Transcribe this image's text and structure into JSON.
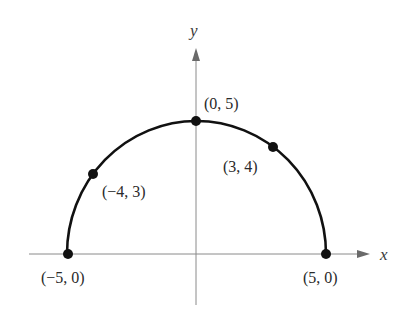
{
  "figure": {
    "axes": {
      "x_label": "x",
      "y_label": "y"
    },
    "points": [
      {
        "label": "(−5, 0)",
        "x": -5,
        "y": 0
      },
      {
        "label": "(−4, 3)",
        "x": -4,
        "y": 3
      },
      {
        "label": "(0, 5)",
        "x": 0,
        "y": 5
      },
      {
        "label": "(3, 4)",
        "x": 3,
        "y": 4
      },
      {
        "label": "(5, 0)",
        "x": 5,
        "y": 0
      }
    ],
    "curve": "upper semicircle of radius 5 centered at origin",
    "colors": {
      "curve": "#111111",
      "axes": "#8a8a8a",
      "text": "#2a2a2a"
    }
  }
}
